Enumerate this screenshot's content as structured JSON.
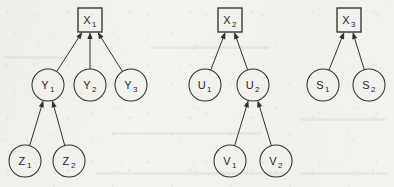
{
  "figure": {
    "background_color": "#f3f3f0",
    "ink_color": "#32312b",
    "width": 394,
    "height": 187
  },
  "chart_data": {
    "type": "diagram",
    "subtype": "directed-acyclic-graph",
    "title": "",
    "legend": [],
    "shapes": {
      "square": "latent-or-composite construct",
      "circle": "indicator variable"
    },
    "arrow_direction": "child-to-parent (upward)",
    "graphs": [
      {
        "id": "graph-1",
        "root": "X1",
        "nodes": [
          {
            "id": "X1",
            "label": "X",
            "sub": "1",
            "shape": "square",
            "cx": 90,
            "cy": 20,
            "size": 24,
            "level": 0
          },
          {
            "id": "Y1",
            "label": "Y",
            "sub": "1",
            "shape": "circle",
            "cx": 48,
            "cy": 85,
            "r": 16,
            "level": 1
          },
          {
            "id": "Y2",
            "label": "Y",
            "sub": "2",
            "shape": "circle",
            "cx": 90,
            "cy": 85,
            "r": 16,
            "level": 1
          },
          {
            "id": "Y3",
            "label": "Y",
            "sub": "3",
            "shape": "circle",
            "cx": 131,
            "cy": 85,
            "r": 16,
            "level": 1
          },
          {
            "id": "Z1",
            "label": "Z",
            "sub": "1",
            "shape": "circle",
            "cx": 25,
            "cy": 161,
            "r": 16,
            "level": 2
          },
          {
            "id": "Z2",
            "label": "Z",
            "sub": "2",
            "shape": "circle",
            "cx": 69,
            "cy": 161,
            "r": 16,
            "level": 2
          }
        ],
        "edges": [
          {
            "from": "Y1",
            "to": "X1"
          },
          {
            "from": "Y2",
            "to": "X1"
          },
          {
            "from": "Y3",
            "to": "X1"
          },
          {
            "from": "Z1",
            "to": "Y1"
          },
          {
            "from": "Z2",
            "to": "Y1"
          }
        ]
      },
      {
        "id": "graph-2",
        "root": "X2",
        "nodes": [
          {
            "id": "X2",
            "label": "X",
            "sub": "2",
            "shape": "square",
            "cx": 230,
            "cy": 20,
            "size": 24,
            "level": 0
          },
          {
            "id": "U1",
            "label": "U",
            "sub": "1",
            "shape": "circle",
            "cx": 205,
            "cy": 85,
            "r": 16,
            "level": 1
          },
          {
            "id": "U2",
            "label": "U",
            "sub": "2",
            "shape": "circle",
            "cx": 253,
            "cy": 85,
            "r": 16,
            "level": 1
          },
          {
            "id": "V1",
            "label": "V",
            "sub": "1",
            "shape": "circle",
            "cx": 230,
            "cy": 161,
            "r": 16,
            "level": 2
          },
          {
            "id": "V2",
            "label": "V",
            "sub": "2",
            "shape": "circle",
            "cx": 276,
            "cy": 161,
            "r": 16,
            "level": 2
          }
        ],
        "edges": [
          {
            "from": "U1",
            "to": "X2"
          },
          {
            "from": "U2",
            "to": "X2"
          },
          {
            "from": "V1",
            "to": "U2"
          },
          {
            "from": "V2",
            "to": "U2"
          }
        ]
      },
      {
        "id": "graph-3",
        "root": "X3",
        "nodes": [
          {
            "id": "X3",
            "label": "X",
            "sub": "3",
            "shape": "square",
            "cx": 349,
            "cy": 20,
            "size": 24,
            "level": 0
          },
          {
            "id": "S1",
            "label": "S",
            "sub": "1",
            "shape": "circle",
            "cx": 323,
            "cy": 85,
            "r": 16,
            "level": 1
          },
          {
            "id": "S2",
            "label": "S",
            "sub": "2",
            "shape": "circle",
            "cx": 369,
            "cy": 85,
            "r": 16,
            "level": 1
          }
        ],
        "edges": [
          {
            "from": "S1",
            "to": "X3"
          },
          {
            "from": "S2",
            "to": "X3"
          }
        ]
      }
    ]
  }
}
